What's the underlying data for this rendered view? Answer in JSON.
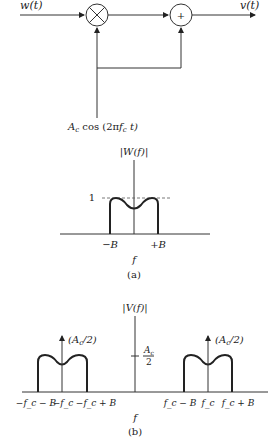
{
  "block_diagram": {
    "input_label": "w(t)",
    "output_label": "v(t)",
    "multiplier_symbol": "×",
    "adder_symbol": "+",
    "carrier_label": "A_c cos (2πf_c t)",
    "carrier_parts": {
      "A": "A",
      "c_sub": "c",
      "cos": " cos (2π",
      "f": "f",
      "fc_sub": "c",
      "t": " t)"
    }
  },
  "part_a": {
    "axis_label": "|W(f)|",
    "level_label": "1",
    "tick_labels": [
      "−B",
      "+B"
    ],
    "x_label": "f",
    "caption": "(a)"
  },
  "part_b": {
    "axis_label": "|V(f)|",
    "impulse_labels": [
      "(A_c/2)",
      "(A_c/2)"
    ],
    "impulse_label_parts": {
      "open": "(A",
      "sub": "c",
      "close": "/2)"
    },
    "level_label_num": "A_c",
    "level_num_A": "A",
    "level_num_sub": "c",
    "level_label_den": "2",
    "tick_labels": [
      "−f_c − B",
      "−f_c",
      "−f_c + B",
      "f_c − B",
      "f_c",
      "f_c + B"
    ],
    "x_label": "f",
    "caption": "(b)"
  }
}
